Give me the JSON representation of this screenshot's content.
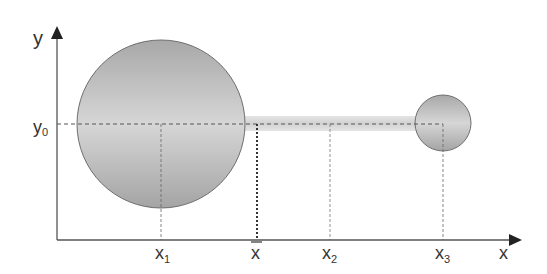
{
  "diagram": {
    "axes": {
      "y_label": "y",
      "x_label": "x",
      "y0_label": "y",
      "y0_sub": "0"
    },
    "x_ticks": [
      {
        "main": "x",
        "sub": "1"
      },
      {
        "main": "x",
        "sub": "",
        "bar": true
      },
      {
        "main": "x",
        "sub": "2"
      },
      {
        "main": "x",
        "sub": "3"
      }
    ],
    "objects": {
      "large_sphere": "mass at x1",
      "rod": "connecting rod",
      "small_sphere": "mass at x3"
    },
    "colors": {
      "axis": "#555555",
      "sphere_edge": "#6e6e6e",
      "sphere_dark": "#a9a9a9",
      "sphere_light": "#d4d4d4",
      "rod": "#d8d8d8",
      "dash": "#555555"
    }
  }
}
